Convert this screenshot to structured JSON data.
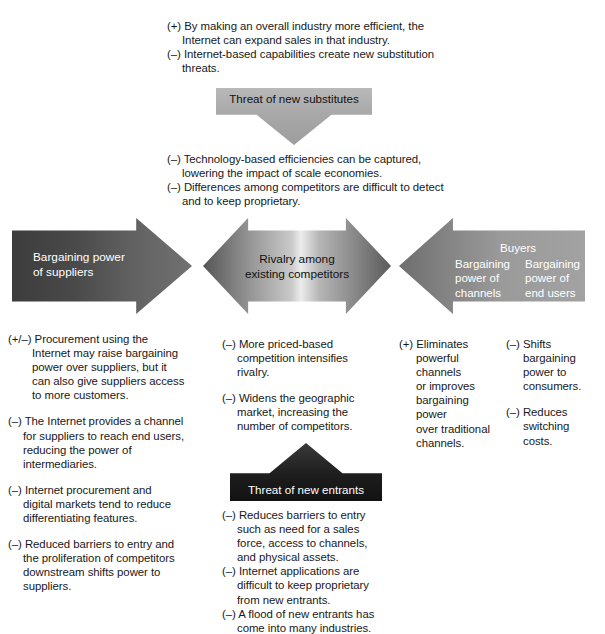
{
  "diagram": {
    "colors": {
      "suppliers_arrow": "#4a4a4a",
      "rivalry_arrow": "#c9c9c9",
      "buyers_arrow": "#8d8d8d",
      "substitutes_arrow": "#a8a8a8",
      "entrants_arrow": "#1d1d1d",
      "text": "#17181a"
    }
  },
  "substitutes": {
    "notes": "(+) By making an overall industry more efficient, the\n     Internet can expand sales in that industry.\n(–) Internet-based capabilities create new substitution\n     threats.",
    "note_1": "(+) By making an overall industry more efficient, the\nInternet can expand sales in that industry.",
    "note_2": "(–) Internet-based capabilities create new substitution\nthreats.",
    "box_label": "Threat of new substitutes",
    "below_1": "(–) Technology-based efficiencies can be captured,\nlowering the impact of scale economies.",
    "below_2": "(–) Differences among competitors are difficult to detect\nand to keep proprietary."
  },
  "suppliers": {
    "arrow_label": "Bargaining power\nof suppliers",
    "notes": [
      "(+/–) Procurement using the\nInternet may raise bargaining\npower over suppliers, but it\ncan also give suppliers access\nto more customers.",
      "(–) The Internet provides a channel\nfor suppliers to reach end users,\nreducing the power of\nintermediaries.",
      "(–) Internet procurement and\ndigital markets tend to reduce\ndifferentiating features.",
      "(–) Reduced barriers to entry and\nthe proliferation of competitors\ndownstream shifts power to\nsuppliers."
    ]
  },
  "rivalry": {
    "arrow_label": "Rivalry among\nexisting competitors",
    "notes": [
      "(–) More priced-based\ncompetition intensifies\nrivalry.",
      "(–) Widens the geographic\nmarket, increasing the\nnumber of competitors."
    ]
  },
  "buyers": {
    "arrow_title": "Buyers",
    "arrow_col_1": "Bargaining\npower of\nchannels",
    "arrow_col_2": "Bargaining\npower of\nend users",
    "notes_col_1": [
      "(+) Eliminates\npowerful\nchannels\nor improves\nbargaining\npower\nover traditional\nchannels."
    ],
    "notes_col_2": [
      "(–) Shifts\nbargaining\npower to\nconsumers.",
      "(–) Reduces\nswitching\ncosts."
    ]
  },
  "entrants": {
    "box_label": "Threat of new entrants",
    "notes": [
      "(–) Reduces barriers to entry\nsuch as need for a sales\nforce, access to channels,\nand physical assets.",
      "(–) Internet applications are\ndifficult to keep proprietary\nfrom new entrants.",
      "(–) A flood of new entrants has\ncome into many industries."
    ]
  }
}
